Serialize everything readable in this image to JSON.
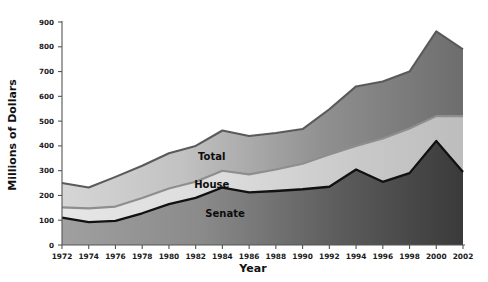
{
  "chart_data": {
    "type": "area",
    "title": "",
    "xlabel": "Year",
    "ylabel": "Millions of Dollars",
    "xlim": [
      1972,
      2002
    ],
    "ylim": [
      0,
      900
    ],
    "ytick_step": 100,
    "xtick_step": 2,
    "grid": false,
    "stacked": true,
    "legend_position": "inline-annotations",
    "categories": [
      1972,
      1974,
      1976,
      1978,
      1980,
      1982,
      1984,
      1986,
      1988,
      1990,
      1992,
      1994,
      1996,
      1998,
      2000,
      2002
    ],
    "x": [
      1972,
      1974,
      1976,
      1978,
      1980,
      1982,
      1984,
      1986,
      1988,
      1990,
      1992,
      1994,
      1996,
      1998,
      2000,
      2002
    ],
    "xticks": [
      "1972",
      "1974",
      "1976",
      "1978",
      "1980",
      "1982",
      "1984",
      "1986",
      "1988",
      "1990",
      "1992",
      "1994",
      "1996",
      "1998",
      "2000",
      "2002"
    ],
    "yticks": [
      "0",
      "100",
      "200",
      "300",
      "400",
      "500",
      "600",
      "700",
      "800",
      "900"
    ],
    "series": [
      {
        "name": "Senate",
        "label": "Senate",
        "cumulative": false,
        "values": [
          110,
          92,
          97,
          128,
          165,
          190,
          232,
          212,
          218,
          225,
          235,
          305,
          255,
          290,
          420,
          295
        ]
      },
      {
        "name": "House",
        "label": "House",
        "cumulative": true,
        "comment": "cumulative Senate+House boundary line",
        "values": [
          152,
          148,
          155,
          190,
          228,
          255,
          300,
          285,
          305,
          328,
          365,
          400,
          430,
          470,
          520,
          520
        ]
      },
      {
        "name": "Total",
        "label": "Total",
        "cumulative": true,
        "comment": "top boundary of stacked area",
        "values": [
          250,
          232,
          275,
          320,
          370,
          400,
          462,
          440,
          452,
          468,
          548,
          640,
          660,
          700,
          862,
          790
        ]
      }
    ],
    "annotations": [
      {
        "text": "Total",
        "x": 1983.2,
        "y": 345
      },
      {
        "text": "House",
        "x": 1983.2,
        "y": 232
      },
      {
        "text": "Senate",
        "x": 1984.2,
        "y": 112
      }
    ],
    "colors": {
      "senate_fill_left": "#9a9a9a",
      "senate_fill_right": "#3e3e3e",
      "house_fill_left": "#e3e3e3",
      "house_fill_right": "#b9b9b9",
      "total_fill_left": "#d4d4d4",
      "total_fill_right": "#6f6f6f",
      "senate_line": "#111111",
      "house_line": "#8e8e8e",
      "total_line": "#5a5a5a",
      "axis": "#555555",
      "text": "#111111",
      "background": "#ffffff"
    }
  }
}
